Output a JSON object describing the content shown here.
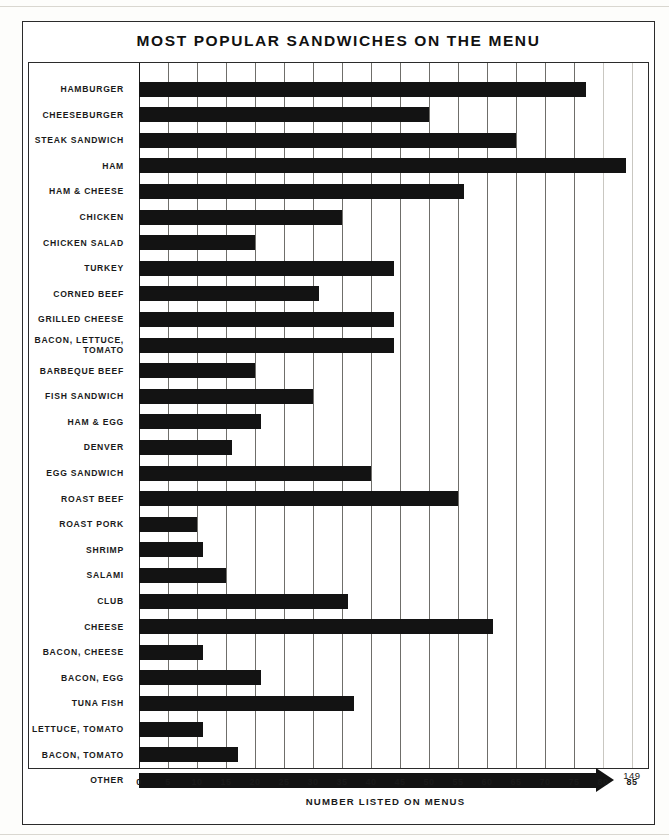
{
  "chart_title": "MOST POPULAR SANDWICHES ON THE MENU",
  "xaxis_title": "NUMBER LISTED ON MENUS",
  "other_value_label": "149",
  "chart_data": {
    "type": "bar",
    "orientation": "horizontal",
    "title": "MOST POPULAR SANDWICHES ON THE MENU",
    "xlabel": "NUMBER LISTED ON MENUS",
    "ylabel": "",
    "xlim": [
      0,
      85
    ],
    "xticks": [
      0,
      5,
      10,
      15,
      20,
      25,
      30,
      35,
      40,
      45,
      50,
      55,
      60,
      65,
      70,
      75,
      80,
      85
    ],
    "grid": true,
    "legend": false,
    "bar_color": "#131313",
    "categories": [
      "HAMBURGER",
      "CHEESEBURGER",
      "STEAK SANDWICH",
      "HAM",
      "HAM & CHEESE",
      "CHICKEN",
      "CHICKEN SALAD",
      "TURKEY",
      "CORNED BEEF",
      "GRILLED CHEESE",
      "BACON, LETTUCE,\nTOMATO",
      "BARBEQUE BEEF",
      "FISH SANDWICH",
      "HAM & EGG",
      "DENVER",
      "EGG SANDWICH",
      "ROAST BEEF",
      "ROAST PORK",
      "SHRIMP",
      "SALAMI",
      "CLUB",
      "CHEESE",
      "BACON, CHEESE",
      "BACON, EGG",
      "TUNA FISH",
      "LETTUCE, TOMATO",
      "BACON, TOMATO",
      "OTHER"
    ],
    "values": [
      77,
      50,
      65,
      84,
      56,
      35,
      20,
      44,
      31,
      44,
      44,
      20,
      30,
      21,
      16,
      40,
      55,
      10,
      11,
      15,
      36,
      61,
      11,
      21,
      37,
      11,
      17,
      149
    ],
    "annotations": [
      {
        "category": "OTHER",
        "text": "149",
        "note": "bar truncated with arrow head at right edge of scale"
      }
    ]
  },
  "rows": [
    {
      "label": "HAMBURGER",
      "value": 77
    },
    {
      "label": "CHEESEBURGER",
      "value": 50
    },
    {
      "label": "STEAK SANDWICH",
      "value": 65
    },
    {
      "label": "HAM",
      "value": 84
    },
    {
      "label": "HAM & CHEESE",
      "value": 56
    },
    {
      "label": "CHICKEN",
      "value": 35
    },
    {
      "label": "CHICKEN SALAD",
      "value": 20
    },
    {
      "label": "TURKEY",
      "value": 44
    },
    {
      "label": "CORNED BEEF",
      "value": 31
    },
    {
      "label": "GRILLED CHEESE",
      "value": 44
    },
    {
      "label": "BACON, LETTUCE,\nTOMATO",
      "value": 44
    },
    {
      "label": "BARBEQUE BEEF",
      "value": 20
    },
    {
      "label": "FISH SANDWICH",
      "value": 30
    },
    {
      "label": "HAM & EGG",
      "value": 21
    },
    {
      "label": "DENVER",
      "value": 16
    },
    {
      "label": "EGG SANDWICH",
      "value": 40
    },
    {
      "label": "ROAST BEEF",
      "value": 55
    },
    {
      "label": "ROAST PORK",
      "value": 10
    },
    {
      "label": "SHRIMP",
      "value": 11
    },
    {
      "label": "SALAMI",
      "value": 15
    },
    {
      "label": "CLUB",
      "value": 36
    },
    {
      "label": "CHEESE",
      "value": 61
    },
    {
      "label": "BACON, CHEESE",
      "value": 11
    },
    {
      "label": "BACON, EGG",
      "value": 21
    },
    {
      "label": "TUNA FISH",
      "value": 37
    },
    {
      "label": "LETTUCE, TOMATO",
      "value": 11
    },
    {
      "label": "BACON, TOMATO",
      "value": 17
    },
    {
      "label": "OTHER",
      "value": 149
    }
  ],
  "xticks": [
    "0",
    "5",
    "10",
    "15",
    "20",
    "25",
    "30",
    "35",
    "40",
    "45",
    "50",
    "55",
    "60",
    "65",
    "70",
    "75",
    "80",
    "85"
  ]
}
